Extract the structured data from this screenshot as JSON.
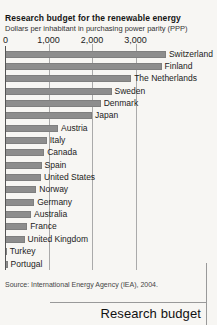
{
  "page": {
    "background": "#f7f6f3",
    "corner_label": "Research budget"
  },
  "chart_data": {
    "type": "bar",
    "orientation": "horizontal",
    "title": "Research budget for the renewable energy",
    "subtitle": "Dollars per inhabitant in purchasing power parity (PPP)",
    "xlabel": "",
    "ylabel": "",
    "x_ticks": [
      "0",
      "1,000",
      "2,000",
      "3,000"
    ],
    "x_tick_values": [
      0,
      1000,
      2000,
      3000
    ],
    "xlim": [
      0,
      3800
    ],
    "grid": true,
    "bar_color": "#8d8d8d",
    "categories": [
      "Switzerland",
      "Finland",
      "The Netherlands",
      "Sweden",
      "Denmark",
      "Japan",
      "Austria",
      "Italy",
      "Canada",
      "Spain",
      "United States",
      "Norway",
      "Germany",
      "Australia",
      "France",
      "United Kingdom",
      "Turkey",
      "Portugal"
    ],
    "values": [
      3700,
      3600,
      2900,
      2450,
      2200,
      2000,
      1220,
      960,
      900,
      840,
      830,
      720,
      670,
      600,
      510,
      450,
      40,
      60
    ],
    "source": "Source: International Energy Agency (IEA), 2004."
  }
}
